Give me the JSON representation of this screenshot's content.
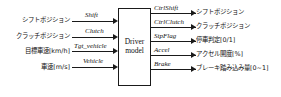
{
  "diagram": {
    "block": {
      "line1": "Driver",
      "line2": "model"
    },
    "inputs": [
      {
        "label": "シフトポジション",
        "signal": "Shift"
      },
      {
        "label": "クラッチポジション",
        "signal": "Clutch"
      },
      {
        "label": "目標車速[km/h]",
        "signal": "Tgt_vehicle"
      },
      {
        "label": "車速[m/s]",
        "signal": "Vehicle"
      }
    ],
    "outputs": [
      {
        "signal": "CtrlShift",
        "label": "シフトポジション"
      },
      {
        "signal": "CtrlClutch",
        "label": "クラッチポジション"
      },
      {
        "signal": "StpFlag",
        "label": "停車判定[0/1]"
      },
      {
        "signal": "Accel",
        "label": "アクセル開度[%]"
      },
      {
        "signal": "Brake",
        "label": "ブレーキ踏み込み量[0~1]"
      }
    ],
    "colors": {
      "line": "#1a1a1a",
      "text": "#111111",
      "background": "#ffffff"
    }
  }
}
